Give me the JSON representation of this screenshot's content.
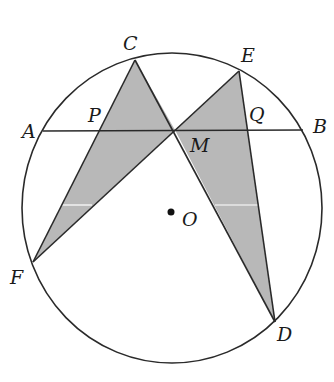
{
  "diagram": {
    "circle": {
      "center_label": "O",
      "cx": 172,
      "cy": 208,
      "rx": 150,
      "ry": 155
    },
    "colors": {
      "stroke": "#2a2a2a",
      "shade": "#b8b8b8",
      "background": "#ffffff"
    },
    "points": {
      "A": {
        "label": "A",
        "x": 43,
        "y": 131
      },
      "B": {
        "label": "B",
        "x": 303,
        "y": 130
      },
      "C": {
        "label": "C",
        "x": 135,
        "y": 60
      },
      "D": {
        "label": "D",
        "x": 275,
        "y": 322
      },
      "E": {
        "label": "E",
        "x": 239,
        "y": 71
      },
      "F": {
        "label": "F",
        "x": 33,
        "y": 262
      },
      "M": {
        "label": "M",
        "x": 175,
        "y": 130
      },
      "P": {
        "label": "P",
        "x": 100,
        "y": 131
      },
      "Q": {
        "label": "Q",
        "x": 247,
        "y": 130
      },
      "O": {
        "label": "O",
        "x": 171,
        "y": 212
      }
    },
    "segments": [
      "AB",
      "CD",
      "EF",
      "CF",
      "ED"
    ],
    "shaded_triangles": [
      "CMF",
      "EMD"
    ]
  }
}
